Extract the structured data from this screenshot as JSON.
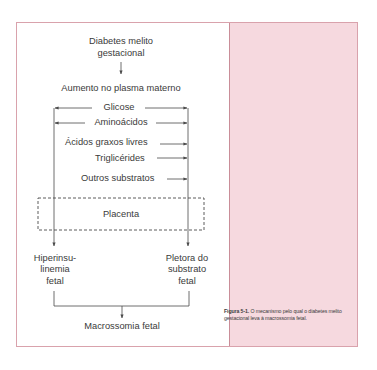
{
  "diagram": {
    "nodes": {
      "top_line1": "Diabetes melito",
      "top_line2": "gestacional",
      "increase": "Aumento no plasma materno",
      "substrates": [
        "Glicose",
        "Aminoácidos",
        "Ácidos graxos livres",
        "Triglicérides",
        "Outros substratos"
      ],
      "placenta": "Placenta",
      "left_out": [
        "Hiperinsu-",
        "linemia",
        "fetal"
      ],
      "right_out": [
        "Pletora do",
        "substrato",
        "fetal"
      ],
      "result": "Macrossomia fetal"
    },
    "colors": {
      "frame_border": "#d9a2ac",
      "right_panel": "#f6d9df",
      "line": "#4a4a4a"
    }
  },
  "caption": {
    "label": "Figura 5-1.",
    "text": "O mecanismo pelo qual o diabetes melito gestacional leva à macrossomia fetal."
  }
}
